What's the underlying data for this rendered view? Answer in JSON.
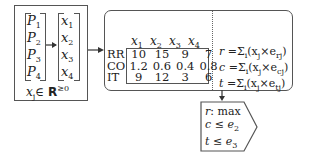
{
  "input_box": {
    "projects": [
      "P",
      "P",
      "P",
      "P"
    ],
    "project_indices": [
      "1",
      "2",
      "3",
      "4"
    ],
    "variables": [
      "x",
      "x",
      "x",
      "x"
    ],
    "variable_indices": [
      "1",
      "2",
      "3",
      "4"
    ],
    "domain": {
      "var": "x",
      "index": "j",
      "in": "∈",
      "set": "R",
      "sup": "≥0"
    }
  },
  "matrix_box": {
    "columns": [
      {
        "var": "x",
        "index": "1"
      },
      {
        "var": "x",
        "index": "2"
      },
      {
        "var": "x",
        "index": "3"
      },
      {
        "var": "x",
        "index": "4"
      }
    ],
    "rows": [
      {
        "label": "RR",
        "values": [
          "10",
          "15",
          "9",
          "7"
        ]
      },
      {
        "label": "CO",
        "values": [
          "1.2",
          "0.6",
          "0.4",
          "0.8"
        ]
      },
      {
        "label": "IT",
        "values": [
          "9",
          "12",
          "3",
          "6"
        ]
      }
    ],
    "formulas": [
      {
        "lhs": "r",
        "eq": "=Σ",
        "sum_index": "i",
        "body": "(x",
        "j": "j",
        "times": "×e",
        "e_index": "rj",
        "close": ")"
      },
      {
        "lhs": "c",
        "eq": "=Σ",
        "sum_index": "i",
        "body": "(x",
        "j": "j",
        "times": "×e",
        "e_index": "cj",
        "close": ")"
      },
      {
        "lhs": "t",
        "eq": "=Σ",
        "sum_index": "i",
        "body": "(x",
        "j": "j",
        "times": "×e",
        "e_index": "tj",
        "close": ")"
      }
    ]
  },
  "objective_box": {
    "lines": [
      {
        "var": "r",
        "rel": ": max",
        "rhs": "",
        "rhs_index": ""
      },
      {
        "var": "c",
        "rel": " ≤ ",
        "rhs": "e",
        "rhs_index": "2"
      },
      {
        "var": "t",
        "rel": " ≤ ",
        "rhs": "e",
        "rhs_index": "3"
      }
    ]
  },
  "colors": {
    "stroke": "#555555",
    "text": "#222222",
    "background": "#ffffff"
  }
}
